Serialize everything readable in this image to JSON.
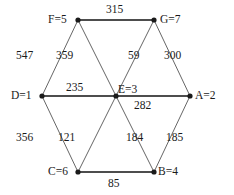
{
  "figure": {
    "type": "graph-diagram",
    "background_color": "#ffffff",
    "node_color": "#1a1a1a",
    "edge_color_primary": "#4d4d4d",
    "edge_color_secondary": "#555555",
    "text_color": "#1a1a1a"
  },
  "nodes": [
    {
      "id": "F",
      "label": "F=5",
      "x": 78,
      "y": 20,
      "label_x": 48,
      "label_y": 14,
      "label_align": "left"
    },
    {
      "id": "G",
      "label": "G=7",
      "x": 154,
      "y": 20,
      "label_x": 160,
      "label_y": 14,
      "label_align": "left"
    },
    {
      "id": "D",
      "label": "D=1",
      "x": 42,
      "y": 96,
      "label_x": 11,
      "label_y": 90,
      "label_align": "left"
    },
    {
      "id": "E",
      "label": "E=3",
      "x": 116,
      "y": 96,
      "label_x": 118,
      "label_y": 84,
      "label_align": "left"
    },
    {
      "id": "A",
      "label": "A=2",
      "x": 190,
      "y": 96,
      "label_x": 195,
      "label_y": 90,
      "label_align": "left"
    },
    {
      "id": "C",
      "label": "C=6",
      "x": 78,
      "y": 172,
      "label_x": 48,
      "label_y": 166,
      "label_align": "left"
    },
    {
      "id": "B",
      "label": "B=4",
      "x": 154,
      "y": 172,
      "label_x": 158,
      "label_y": 166,
      "label_align": "left"
    }
  ],
  "edges": [
    {
      "from": "F",
      "to": "G",
      "weight": "315",
      "label_x": 106,
      "label_y": 4,
      "style": "thick"
    },
    {
      "from": "D",
      "to": "F",
      "weight": "547",
      "label_x": 16,
      "label_y": 50,
      "style": "thin"
    },
    {
      "from": "F",
      "to": "E",
      "weight": "359",
      "label_x": 56,
      "label_y": 50,
      "style": "thin"
    },
    {
      "from": "G",
      "to": "E",
      "weight": "59",
      "label_x": 128,
      "label_y": 50,
      "style": "thin"
    },
    {
      "from": "G",
      "to": "A",
      "weight": "300",
      "label_x": 164,
      "label_y": 50,
      "style": "thin"
    },
    {
      "from": "D",
      "to": "E",
      "weight": "235",
      "label_x": 66,
      "label_y": 82,
      "style": "thick"
    },
    {
      "from": "E",
      "to": "A",
      "weight": "282",
      "label_x": 134,
      "label_y": 100,
      "style": "thick"
    },
    {
      "from": "D",
      "to": "C",
      "weight": "356",
      "label_x": 16,
      "label_y": 132,
      "style": "thin"
    },
    {
      "from": "E",
      "to": "C",
      "weight": "121",
      "label_x": 58,
      "label_y": 132,
      "style": "thin"
    },
    {
      "from": "E",
      "to": "B",
      "weight": "184",
      "label_x": 126,
      "label_y": 132,
      "style": "thin"
    },
    {
      "from": "A",
      "to": "B",
      "weight": "185",
      "label_x": 166,
      "label_y": 132,
      "style": "thin"
    },
    {
      "from": "C",
      "to": "B",
      "weight": "85",
      "label_x": 108,
      "label_y": 178,
      "style": "thick"
    }
  ]
}
